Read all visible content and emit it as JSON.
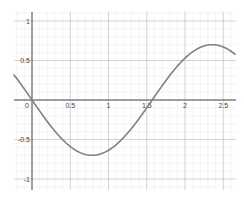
{
  "chart_data": {
    "type": "line",
    "title": "",
    "xlabel": "",
    "ylabel": "",
    "xlim": [
      -0.24,
      2.66
    ],
    "ylim": [
      -1.14,
      1.11
    ],
    "grid": true,
    "minor_grid_step": 0.1,
    "major_grid_step": 0.5,
    "x_ticks": [
      0,
      0.5,
      1,
      1.5,
      2,
      2.5
    ],
    "x_tick_labels": [
      "0",
      "0.5",
      "1",
      "1.5",
      "2",
      "2.5"
    ],
    "y_ticks": [
      1,
      0.5,
      -0.5,
      -1
    ],
    "y_tick_labels": [
      "1",
      "0.5",
      "-0.5",
      "-1"
    ],
    "series": [
      {
        "name": "f(x)",
        "color": "#808080",
        "expression": "-0.7*sin(2x)",
        "x": [
          -0.24,
          0,
          0.25,
          0.5,
          0.785,
          1.0,
          1.25,
          1.5,
          1.57,
          1.75,
          2.0,
          2.25,
          2.36,
          2.5,
          2.66
        ],
        "y": [
          0.31,
          0.0,
          -0.34,
          -0.59,
          -0.7,
          -0.64,
          -0.42,
          -0.1,
          0.0,
          0.25,
          0.53,
          0.68,
          0.7,
          0.67,
          0.58
        ]
      }
    ],
    "legend": null
  },
  "axes": {
    "origin_label": "0"
  }
}
